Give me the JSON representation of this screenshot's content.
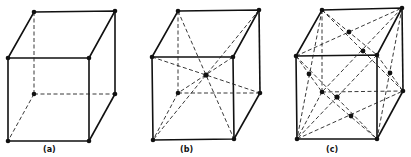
{
  "figures": [
    {
      "id": "a",
      "label": "(a)",
      "lattice": "simple cubic",
      "label_pos": [
        46,
        146
      ]
    },
    {
      "id": "b",
      "label": "(b)",
      "lattice": "body-centered cubic",
      "label_pos": [
        182,
        146
      ]
    },
    {
      "id": "c",
      "label": "(c)",
      "lattice": "face-centered cubic",
      "label_pos": [
        328,
        146
      ]
    }
  ],
  "colors": {
    "line": "#111111",
    "background": "#ffffff"
  }
}
